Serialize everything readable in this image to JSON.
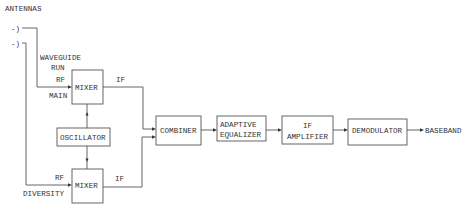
{
  "labels": {
    "antennas": "ANTENNAS",
    "antenna_glyph": "-)",
    "waveguide_line1": "WAVEGUIDE",
    "waveguide_line2": "RUN",
    "rf_top": "RF",
    "main": "MAIN",
    "if_top": "IF",
    "rf_bottom": "RF",
    "diversity": "DIVERSITY",
    "if_bottom": "IF",
    "baseband": "BASEBAND"
  },
  "blocks": {
    "mixer_main": "MIXER",
    "oscillator": "OSCILLATOR",
    "mixer_diversity": "MIXER",
    "combiner": "COMBINER",
    "equalizer_line1": "ADAPTIVE",
    "equalizer_line2": "EQUALIZER",
    "amplifier_line1": "IF",
    "amplifier_line2": "AMPLIFIER",
    "demodulator": "DEMODULATOR"
  },
  "colors": {
    "line": "#555555",
    "text": "#333333",
    "background": "#ffffff"
  }
}
